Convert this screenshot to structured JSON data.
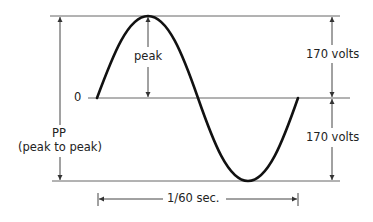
{
  "diagram": {
    "type": "sine-wave-ac-voltage",
    "labels": {
      "peak": "peak",
      "zero": "0",
      "upper_voltage": "170 volts",
      "lower_voltage": "170 volts",
      "pp": "PP",
      "pp_full": "(peak to peak)",
      "period": "1/60 sec."
    },
    "values": {
      "peak_voltage": 170,
      "peak_to_peak_voltage": 340,
      "period_seconds": "1/60"
    },
    "colors": {
      "wave": "#111111",
      "lines": "#555555",
      "text": "#222222"
    }
  }
}
